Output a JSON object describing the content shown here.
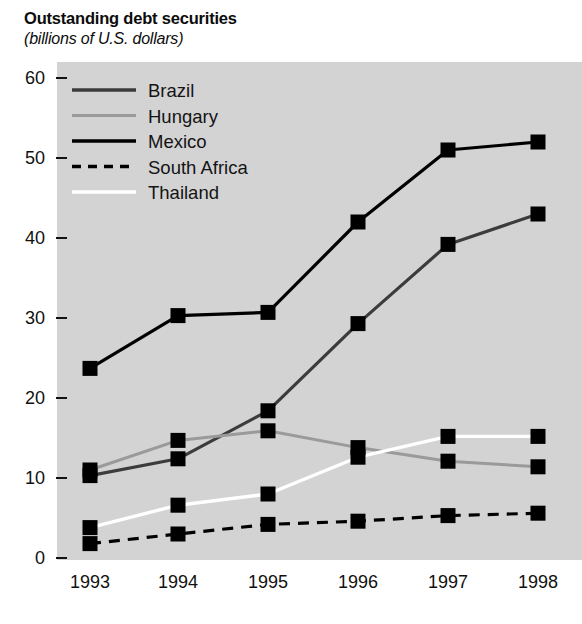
{
  "header": {
    "title": "Outstanding debt securities",
    "subtitle": "(billions of U.S. dollars)"
  },
  "colors": {
    "plot_background": "#d3d3d3",
    "page_background": "#ffffff",
    "brazil": "#3c3c3c",
    "hungary": "#9a9a9a",
    "mexico": "#000000",
    "south_africa": "#000000",
    "thailand": "#ffffff",
    "marker": "#000000",
    "axis": "#111111",
    "text": "#0c0c0c"
  },
  "chart_data": {
    "type": "line",
    "title": "Outstanding debt securities",
    "subtitle": "(billions of U.S. dollars)",
    "xlabel": "",
    "ylabel": "(billions of U.S. dollars)",
    "categories": [
      "1993",
      "1994",
      "1995",
      "1996",
      "1997",
      "1998"
    ],
    "x": [
      1993,
      1994,
      1995,
      1996,
      1997,
      1998
    ],
    "ylim": [
      0,
      60
    ],
    "yticks": [
      0,
      10,
      20,
      30,
      40,
      50,
      60
    ],
    "grid": false,
    "legend_position": "upper-left-inside",
    "markers": "filled square",
    "series": [
      {
        "name": "Brazil",
        "color": "#3c3c3c",
        "style": "solid",
        "values": [
          10.3,
          12.4,
          18.4,
          29.3,
          39.2,
          43.0
        ]
      },
      {
        "name": "Hungary",
        "color": "#9a9a9a",
        "style": "solid",
        "values": [
          11.0,
          14.7,
          15.9,
          13.8,
          12.1,
          11.4
        ]
      },
      {
        "name": "Mexico",
        "color": "#000000",
        "style": "solid",
        "values": [
          23.7,
          30.3,
          30.7,
          42.0,
          51.0,
          52.0
        ]
      },
      {
        "name": "South Africa",
        "color": "#000000",
        "style": "dashed",
        "values": [
          1.8,
          3.0,
          4.2,
          4.6,
          5.3,
          5.6
        ]
      },
      {
        "name": "Thailand",
        "color": "#ffffff",
        "style": "solid",
        "values": [
          3.8,
          6.6,
          8.0,
          12.6,
          15.2,
          15.2
        ]
      }
    ]
  },
  "legend": {
    "items": [
      {
        "label": "Brazil",
        "key": "brazil"
      },
      {
        "label": "Hungary",
        "key": "hungary"
      },
      {
        "label": "Mexico",
        "key": "mexico"
      },
      {
        "label": "South Africa",
        "key": "south_africa"
      },
      {
        "label": "Thailand",
        "key": "thailand"
      }
    ]
  },
  "axes": {
    "y_tick_labels": [
      "60",
      "50",
      "40",
      "30",
      "20",
      "10",
      "0"
    ],
    "x_tick_labels": [
      "1993",
      "1994",
      "1995",
      "1996",
      "1997",
      "1998"
    ]
  }
}
